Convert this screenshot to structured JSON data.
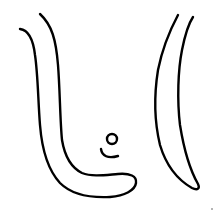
{
  "drawing": {
    "description": "Line drawing: left curved U-shaped stroke, right crescent stroke, small circle with smile curve in center",
    "stroke_color": "#000000",
    "background_color": "#ffffff",
    "shapes": [
      {
        "name": "left-curved-band",
        "type": "path"
      },
      {
        "name": "right-crescent",
        "type": "path"
      },
      {
        "name": "small-circle",
        "type": "circle"
      },
      {
        "name": "smile-curve",
        "type": "path"
      }
    ]
  }
}
